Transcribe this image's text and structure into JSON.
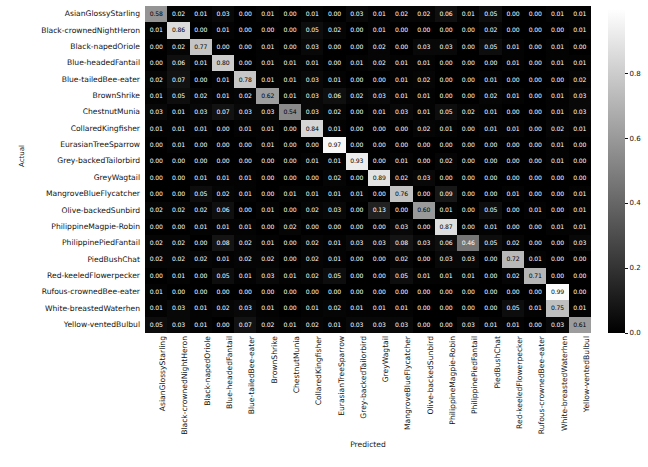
{
  "chart_data": {
    "type": "heatmap",
    "title": "",
    "xlabel": "Predicted",
    "ylabel": "Actual",
    "colormap": "gray",
    "legend_position": "right",
    "grid": false,
    "zlim": [
      0.0,
      1.0
    ],
    "colorbar_ticks": [
      "0.0",
      "0.2",
      "0.4",
      "0.6",
      "0.8"
    ],
    "colorbar_tick_values": [
      0.0,
      0.2,
      0.4,
      0.6,
      0.8
    ],
    "categories": [
      "AsianGlossyStarling",
      "Black-crownedNightHeron",
      "Black-napedOriole",
      "Blue-headedFantail",
      "Blue-tailedBee-eater",
      "BrownShrike",
      "ChestnutMunia",
      "CollaredKingfisher",
      "EurasianTreeSparrow",
      "Grey-backedTailorbird",
      "GreyWagtail",
      "MangroveBlueFlycatcher",
      "Olive-backedSunbird",
      "PhilippineMagpie-Robin",
      "PhilippinePiedFantail",
      "PiedBushChat",
      "Red-keeledFlowerpecker",
      "Rufous-crownedBee-eater",
      "White-breastedWaterhen",
      "Yellow-ventedBulbul"
    ],
    "x_categories": [
      "AsianGlossyStarling",
      "Black-crownedNightHeron",
      "Black-napedOriole",
      "Blue-headedFantail",
      "Blue-tailedBee-eater",
      "BrownShrike",
      "ChestnutMunia",
      "CollaredKingfisher",
      "EurasianTreeSparrow",
      "Grey-backedTailorbird",
      "GreyWagtail",
      "MangroveBlueFlycatcher",
      "Olive-backedSunbird",
      "PhilippineMagpie-Robin",
      "PhilippinePiedFantail",
      "PiedBushChat",
      "Red-keeledFlowerpecker",
      "Rufous-crownedBee-eater",
      "White-breastedWaterhen",
      "Yellow-ventedBulbul"
    ],
    "values": [
      [
        0.58,
        0.02,
        0.01,
        0.03,
        0.0,
        0.01,
        0.0,
        0.01,
        0.0,
        0.03,
        0.01,
        0.02,
        0.02,
        0.06,
        0.01,
        0.05,
        0.0,
        0.0,
        0.01,
        0.01
      ],
      [
        0.01,
        0.86,
        0.0,
        0.01,
        0.0,
        0.0,
        0.0,
        0.05,
        0.02,
        0.0,
        0.01,
        0.0,
        0.0,
        0.0,
        0.0,
        0.02,
        0.0,
        0.0,
        0.0,
        0.01
      ],
      [
        0.0,
        0.02,
        0.77,
        0.0,
        0.0,
        0.01,
        0.0,
        0.03,
        0.0,
        0.0,
        0.02,
        0.0,
        0.03,
        0.03,
        0.0,
        0.05,
        0.01,
        0.0,
        0.01,
        0.0
      ],
      [
        0.0,
        0.06,
        0.01,
        0.8,
        0.0,
        0.01,
        0.01,
        0.01,
        0.0,
        0.01,
        0.02,
        0.01,
        0.01,
        0.0,
        0.0,
        0.0,
        0.01,
        0.0,
        0.01,
        0.01
      ],
      [
        0.02,
        0.07,
        0.0,
        0.01,
        0.78,
        0.01,
        0.01,
        0.03,
        0.01,
        0.0,
        0.0,
        0.01,
        0.02,
        0.0,
        0.0,
        0.01,
        0.0,
        0.0,
        0.0,
        0.02
      ],
      [
        0.01,
        0.05,
        0.02,
        0.01,
        0.02,
        0.62,
        0.01,
        0.03,
        0.06,
        0.02,
        0.03,
        0.01,
        0.01,
        0.0,
        0.0,
        0.02,
        0.01,
        0.0,
        0.01,
        0.03
      ],
      [
        0.03,
        0.01,
        0.03,
        0.07,
        0.03,
        0.03,
        0.54,
        0.03,
        0.02,
        0.0,
        0.01,
        0.03,
        0.01,
        0.05,
        0.02,
        0.01,
        0.0,
        0.0,
        0.01,
        0.03
      ],
      [
        0.01,
        0.01,
        0.01,
        0.0,
        0.01,
        0.01,
        0.0,
        0.84,
        0.01,
        0.0,
        0.0,
        0.0,
        0.02,
        0.01,
        0.0,
        0.01,
        0.01,
        0.0,
        0.02,
        0.01
      ],
      [
        0.0,
        0.01,
        0.0,
        0.0,
        0.0,
        0.01,
        0.0,
        0.0,
        0.97,
        0.0,
        0.0,
        0.0,
        0.0,
        0.0,
        0.0,
        0.0,
        0.0,
        0.0,
        0.01,
        0.0
      ],
      [
        0.0,
        0.0,
        0.0,
        0.0,
        0.0,
        0.0,
        0.0,
        0.01,
        0.01,
        0.93,
        0.0,
        0.01,
        0.0,
        0.02,
        0.0,
        0.0,
        0.0,
        0.0,
        0.01,
        0.0
      ],
      [
        0.0,
        0.0,
        0.01,
        0.01,
        0.01,
        0.0,
        0.0,
        0.0,
        0.02,
        0.0,
        0.89,
        0.02,
        0.03,
        0.0,
        0.0,
        0.0,
        0.0,
        0.0,
        0.0,
        0.0
      ],
      [
        0.0,
        0.0,
        0.05,
        0.02,
        0.01,
        0.0,
        0.01,
        0.01,
        0.01,
        0.01,
        0.0,
        0.76,
        0.0,
        0.09,
        0.0,
        0.0,
        0.01,
        0.0,
        0.0,
        0.01
      ],
      [
        0.02,
        0.02,
        0.02,
        0.06,
        0.0,
        0.01,
        0.0,
        0.02,
        0.03,
        0.0,
        0.13,
        0.0,
        0.6,
        0.01,
        0.0,
        0.05,
        0.0,
        0.01,
        0.0,
        0.01
      ],
      [
        0.0,
        0.0,
        0.01,
        0.01,
        0.01,
        0.0,
        0.02,
        0.0,
        0.0,
        0.0,
        0.0,
        0.03,
        0.0,
        0.87,
        0.0,
        0.01,
        0.0,
        0.0,
        0.01,
        0.01
      ],
      [
        0.02,
        0.02,
        0.0,
        0.08,
        0.02,
        0.01,
        0.0,
        0.02,
        0.01,
        0.03,
        0.03,
        0.08,
        0.03,
        0.06,
        0.46,
        0.05,
        0.02,
        0.0,
        0.0,
        0.03
      ],
      [
        0.02,
        0.02,
        0.02,
        0.01,
        0.02,
        0.02,
        0.0,
        0.02,
        0.01,
        0.0,
        0.0,
        0.02,
        0.0,
        0.03,
        0.03,
        0.0,
        0.72,
        0.01,
        0.0,
        0.0
      ],
      [
        0.0,
        0.01,
        0.0,
        0.05,
        0.01,
        0.03,
        0.01,
        0.02,
        0.05,
        0.0,
        0.0,
        0.05,
        0.01,
        0.01,
        0.01,
        0.0,
        0.02,
        0.71,
        0.0,
        0.0
      ],
      [
        0.01,
        0.0,
        0.0,
        0.0,
        0.0,
        0.0,
        0.0,
        0.0,
        0.0,
        0.0,
        0.0,
        0.0,
        0.0,
        0.0,
        0.0,
        0.0,
        0.0,
        0.0,
        0.99,
        0.0
      ],
      [
        0.01,
        0.03,
        0.01,
        0.02,
        0.03,
        0.01,
        0.0,
        0.01,
        0.02,
        0.01,
        0.01,
        0.01,
        0.0,
        0.0,
        0.0,
        0.0,
        0.05,
        0.01,
        0.75,
        0.01
      ],
      [
        0.05,
        0.03,
        0.01,
        0.0,
        0.07,
        0.02,
        0.01,
        0.02,
        0.01,
        0.03,
        0.03,
        0.03,
        0.0,
        0.0,
        0.03,
        0.01,
        0.01,
        0.0,
        0.03,
        0.61
      ]
    ]
  }
}
